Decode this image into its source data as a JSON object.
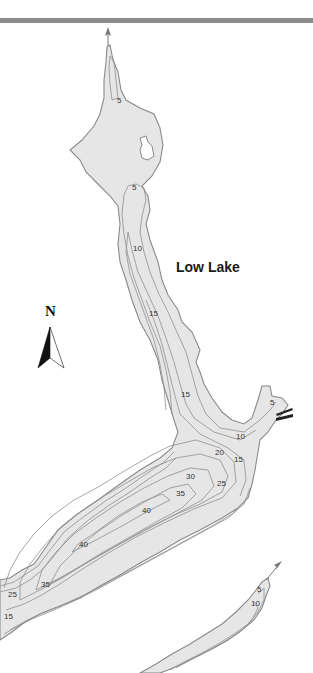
{
  "map": {
    "title": "Low Lake",
    "north_label": "N",
    "colors": {
      "water": "#e6e6e6",
      "shoreline": "#8a8a8a",
      "contour": "#8f8f8f",
      "label": "#333333",
      "top_rule": "#8c8c8c"
    },
    "depth_labels": [
      {
        "value": "5",
        "x": 117,
        "y": 103
      },
      {
        "value": "5",
        "x": 132,
        "y": 190
      },
      {
        "value": "10",
        "x": 133,
        "y": 251
      },
      {
        "value": "15",
        "x": 149,
        "y": 316
      },
      {
        "value": "15",
        "x": 181,
        "y": 397
      },
      {
        "value": "5",
        "x": 270,
        "y": 405
      },
      {
        "value": "10",
        "x": 236,
        "y": 439
      },
      {
        "value": "20",
        "x": 215,
        "y": 455
      },
      {
        "value": "15",
        "x": 234,
        "y": 462
      },
      {
        "value": "30",
        "x": 186,
        "y": 479
      },
      {
        "value": "25",
        "x": 217,
        "y": 486
      },
      {
        "value": "35",
        "x": 176,
        "y": 496
      },
      {
        "value": "40",
        "x": 142,
        "y": 513
      },
      {
        "value": "40",
        "x": 79,
        "y": 547
      },
      {
        "value": "35",
        "x": 41,
        "y": 587
      },
      {
        "value": "25",
        "x": 8,
        "y": 597
      },
      {
        "value": "15",
        "x": 4,
        "y": 619
      },
      {
        "value": "5",
        "x": 257,
        "y": 592
      },
      {
        "value": "10",
        "x": 251,
        "y": 606
      }
    ],
    "features": [
      "north-arrow",
      "inflow-arrow-north",
      "inflow-arrow-southeast",
      "boat-launch",
      "island"
    ]
  }
}
